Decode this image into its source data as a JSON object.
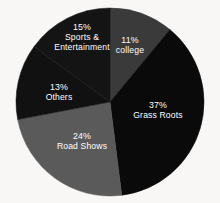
{
  "chart_data": {
    "type": "pie",
    "title": "",
    "xlabel": "",
    "ylabel": "",
    "categories": [
      "college",
      "Grass Roots",
      "Road Shows",
      "Others",
      "Sports & Entertainment"
    ],
    "values": [
      11,
      37,
      24,
      13,
      15
    ],
    "value_unit": "%",
    "legend_position": "none",
    "grid": false,
    "start_angle_deg": 0,
    "direction": "clockwise",
    "slices": [
      {
        "label": "college",
        "value": 11,
        "pct_text": "11%",
        "label_lines": [
          "11%",
          "college"
        ],
        "color": "#3a3a3a",
        "label_color": "#ffffff",
        "label_x": 130,
        "label_y": 46
      },
      {
        "label": "Grass Roots",
        "value": 37,
        "pct_text": "37%",
        "label_lines": [
          "37%",
          "Grass Roots"
        ],
        "color": "#0a0a0a",
        "label_color": "#ffffff",
        "label_x": 158,
        "label_y": 111
      },
      {
        "label": "Road Shows",
        "value": 24,
        "pct_text": "24%",
        "label_lines": [
          "24%",
          "Road Shows"
        ],
        "color": "#5a5a5a",
        "label_color": "#ffffff",
        "label_x": 82,
        "label_y": 142
      },
      {
        "label": "Others",
        "value": 13,
        "pct_text": "13%",
        "label_lines": [
          "13%",
          "Others"
        ],
        "color": "#111111",
        "label_color": "#ffffff",
        "label_x": 59,
        "label_y": 93
      },
      {
        "label": "Sports & Entertainment",
        "value": 15,
        "pct_text": "15%",
        "label_lines": [
          "15%",
          "Sports &",
          "Entertainment"
        ],
        "color": "#141414",
        "label_color": "#ffffff",
        "label_x": 82,
        "label_y": 38
      }
    ],
    "geometry": {
      "center_x": 110,
      "center_y": 102,
      "radius": 94
    },
    "background_color": "#f8f7f5"
  },
  "figure": {
    "cropped_title_remnant": ""
  }
}
